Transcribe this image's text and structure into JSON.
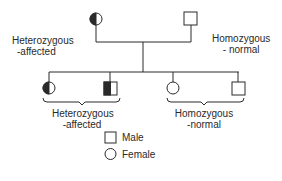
{
  "diagram": {
    "type": "pedigree",
    "parents": {
      "mother": {
        "sex": "female",
        "status": "Heterozygous -affected",
        "label_line1": "Heterozygous",
        "label_line2": "-affected"
      },
      "father": {
        "sex": "male",
        "status": "Homozygous -normal",
        "label_line1": "Homozygous",
        "label_line2": "- normal"
      }
    },
    "children": [
      {
        "sex": "female",
        "status": "heterozygous-affected"
      },
      {
        "sex": "male",
        "status": "heterozygous-affected"
      },
      {
        "sex": "female",
        "status": "homozygous-normal"
      },
      {
        "sex": "male",
        "status": "homozygous-normal"
      }
    ],
    "group_labels": {
      "affected_line1": "Heterozygous",
      "affected_line2": "-affected",
      "normal_line1": "Homozygous",
      "normal_line2": "-normal"
    },
    "legend": {
      "male": "Male",
      "female": "Female"
    }
  }
}
